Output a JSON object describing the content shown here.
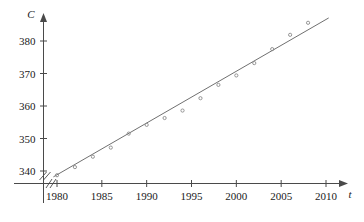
{
  "chart_data": {
    "type": "scatter",
    "title": "",
    "xlabel": "t",
    "ylabel": "C",
    "xlim": [
      1978.4,
      2011.5
    ],
    "ylim": [
      336.5,
      386.5
    ],
    "grid": false,
    "legend_position": "none",
    "axis_break_x": true,
    "axis_break_y": true,
    "x_ticks": [
      1980,
      1985,
      1990,
      1995,
      2000,
      2005,
      2010
    ],
    "x_tick_labels": [
      "1980",
      "1985",
      "1990",
      "1995",
      "2000",
      "2005",
      "2010"
    ],
    "y_ticks": [
      340,
      350,
      360,
      370,
      380
    ],
    "y_tick_labels": [
      "340",
      "350",
      "360",
      "370",
      "380"
    ],
    "x": [
      1980,
      1982,
      1984,
      1986,
      1988,
      1990,
      1992,
      1994,
      1996,
      1998,
      2000,
      2002,
      2004,
      2006,
      2008
    ],
    "y": [
      338.7,
      341.2,
      344.4,
      347.2,
      351.5,
      354.2,
      356.3,
      358.6,
      362.4,
      366.5,
      369.4,
      373.2,
      377.5,
      381.9,
      385.6
    ],
    "series": [
      {
        "name": "observations",
        "marker": "circle",
        "color": "#8a8a8a",
        "values": [
          338.7,
          341.2,
          344.4,
          347.2,
          351.5,
          354.2,
          356.3,
          358.6,
          362.4,
          366.5,
          369.4,
          373.2,
          377.5,
          381.9,
          385.6
        ]
      }
    ],
    "regression_line": {
      "name": "least-squares fit",
      "color": "#707070",
      "x_start": 1979.6,
      "y_start": 338.2,
      "x_end": 2010.3,
      "y_end": 387.1
    }
  }
}
